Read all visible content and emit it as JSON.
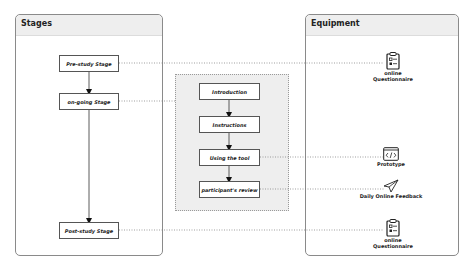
{
  "stages_panel": {
    "title": "Stages",
    "items": [
      {
        "label": "Pre-study Stage"
      },
      {
        "label": "on-going Stage"
      },
      {
        "label": "Post-study Stage"
      }
    ]
  },
  "ongoing_group": {
    "steps": [
      {
        "label": "Introduction"
      },
      {
        "label": "Instructions"
      },
      {
        "label": "Using the tool"
      },
      {
        "label": "participant's review"
      }
    ]
  },
  "equipment_panel": {
    "title": "Equipment",
    "items": [
      {
        "label_line1": "online",
        "label_line2": "Questionnaire",
        "icon": "clipboard-checklist-icon"
      },
      {
        "label_line1": "Prototype",
        "label_line2": "",
        "icon": "code-window-icon"
      },
      {
        "label_line1": "Daily Online Feedback",
        "label_line2": "",
        "icon": "paper-plane-icon"
      },
      {
        "label_line1": "online",
        "label_line2": "Questionnaire",
        "icon": "clipboard-checklist-icon"
      }
    ]
  },
  "colors": {
    "border": "#8a8a8a",
    "header_fill": "#eeeeee",
    "group_fill": "#eeeeee",
    "line": "#555555"
  }
}
